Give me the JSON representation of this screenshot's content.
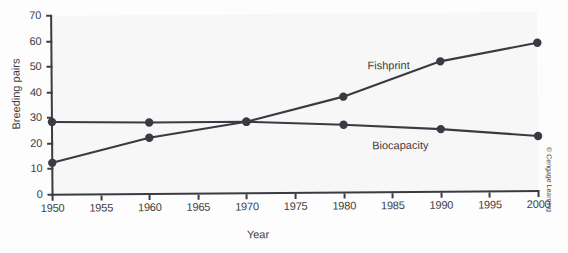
{
  "chart_data": {
    "type": "line",
    "title": "",
    "xlabel": "Year",
    "ylabel": "Breeding pairs",
    "x": [
      1950,
      1960,
      1970,
      1980,
      1990,
      2000
    ],
    "xlim": [
      1950,
      2000
    ],
    "ylim": [
      0,
      70
    ],
    "xticks": [
      1950,
      1955,
      1960,
      1965,
      1970,
      1975,
      1980,
      1985,
      1990,
      1995,
      2000
    ],
    "yticks": [
      0,
      10,
      20,
      30,
      40,
      50,
      60,
      70
    ],
    "grid": false,
    "legend_position": "inline-labels",
    "series": [
      {
        "name": "Fishprint",
        "values": [
          12.5,
          22.0,
          28.0,
          37.5,
          51.0,
          58.0
        ],
        "color": "#3a3a42"
      },
      {
        "name": "Biocapacity",
        "values": [
          28.5,
          28.0,
          28.0,
          26.5,
          24.5,
          21.5
        ],
        "color": "#3a3a42"
      }
    ],
    "annotations": [
      {
        "text": "Fishprint",
        "series": "Fishprint"
      },
      {
        "text": "Biocapacity",
        "series": "Biocapacity"
      }
    ]
  },
  "figure": {
    "credit": "© Cengage Learning",
    "plot_background": "#f7f7f7",
    "axis_color": "#3b3b42",
    "text_color": "#3c3c42"
  }
}
